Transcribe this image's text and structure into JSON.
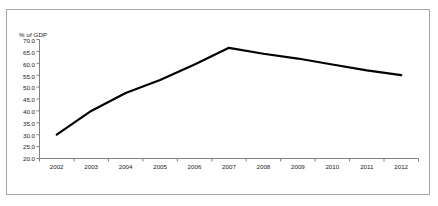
{
  "chart_data": {
    "type": "line",
    "title": "",
    "ylabel": "% of GDP",
    "xlabel": "",
    "categories": [
      "2002",
      "2003",
      "2004",
      "2005",
      "2006",
      "2007",
      "2008",
      "2009",
      "2010",
      "2011",
      "2012"
    ],
    "x": [
      2002,
      2003,
      2004,
      2005,
      2006,
      2007,
      2008,
      2009,
      2010,
      2011,
      2012
    ],
    "values": [
      30.0,
      40.0,
      47.5,
      53.0,
      59.5,
      66.5,
      64.0,
      62.0,
      59.5,
      57.0,
      55.0
    ],
    "series": [
      {
        "name": "% of GDP",
        "values": [
          30.0,
          40.0,
          47.5,
          53.0,
          59.5,
          66.5,
          64.0,
          62.0,
          59.5,
          57.0,
          55.0
        ]
      }
    ],
    "ylim": [
      20.0,
      70.0
    ],
    "ytick_labels": [
      "70.0",
      "65.0",
      "60.0",
      "55.0",
      "50.0",
      "45.0",
      "40.0",
      "35.0",
      "30.0",
      "25.0",
      "20.0"
    ],
    "ytick_values": [
      70.0,
      65.0,
      60.0,
      55.0,
      50.0,
      45.0,
      40.0,
      35.0,
      30.0,
      25.0,
      20.0
    ],
    "grid": false,
    "legend": "none",
    "line_color": "#000000",
    "axis_color": "#808080",
    "frame_color": "#a6a6a6",
    "background": "#ffffff"
  }
}
